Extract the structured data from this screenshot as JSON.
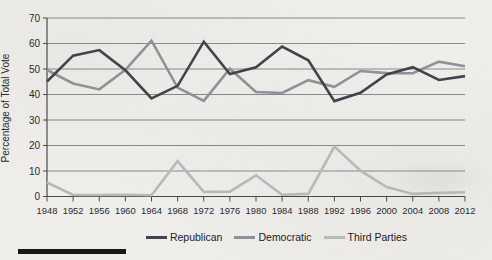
{
  "page": {
    "background_color": "#efeeeb",
    "rule_bar_color": "#191919"
  },
  "chart_data": {
    "type": "line",
    "title": "",
    "xlabel": "",
    "ylabel": "Percentage of Total Vote",
    "ylim": [
      0,
      70
    ],
    "ytick_step": 10,
    "grid": true,
    "legend_position": "bottom",
    "categories": [
      "1948",
      "1952",
      "1956",
      "1960",
      "1964",
      "1968",
      "1972",
      "1976",
      "1980",
      "1984",
      "1988",
      "1992",
      "1996",
      "2000",
      "2004",
      "2008",
      "2012"
    ],
    "series": [
      {
        "name": "Republican",
        "color": "#40454b",
        "values": [
          45.1,
          55.2,
          57.4,
          49.5,
          38.5,
          43.4,
          60.7,
          48.0,
          50.7,
          58.8,
          53.4,
          37.4,
          40.7,
          47.9,
          50.7,
          45.7,
          47.2
        ]
      },
      {
        "name": "Democratic",
        "color": "#8e9296",
        "values": [
          49.6,
          44.3,
          42.0,
          49.7,
          61.1,
          42.7,
          37.5,
          50.1,
          41.0,
          40.6,
          45.6,
          43.0,
          49.2,
          48.4,
          48.3,
          52.9,
          51.1
        ]
      },
      {
        "name": "Third Parties",
        "color": "#b6b9bb",
        "values": [
          5.5,
          0.6,
          0.6,
          0.7,
          0.5,
          13.9,
          1.8,
          1.9,
          8.3,
          0.7,
          1.0,
          19.6,
          10.1,
          3.7,
          1.0,
          1.4,
          1.7
        ]
      }
    ]
  }
}
